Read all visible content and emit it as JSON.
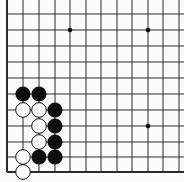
{
  "board": {
    "description": "Go board corner fragment (lower-left corner with stones)",
    "background": "#fbfbfb",
    "line_color": "#2a2a2a",
    "columns_x": [
      7,
      23,
      39,
      55,
      70,
      86,
      101,
      117,
      132,
      148,
      163,
      179
    ],
    "rows_y": [
      14,
      30,
      46,
      62,
      78,
      94,
      110,
      126,
      142,
      157,
      172
    ],
    "left_edge_x": 7,
    "bottom_edge_y": 172,
    "star_points": [
      {
        "col": 4,
        "row": 1
      },
      {
        "col": 9,
        "row": 1
      },
      {
        "col": 9,
        "row": 7
      }
    ],
    "stones": [
      {
        "color": "black",
        "col": 1,
        "row": 5
      },
      {
        "color": "black",
        "col": 2,
        "row": 5
      },
      {
        "color": "white",
        "col": 1,
        "row": 6
      },
      {
        "color": "white",
        "col": 2,
        "row": 6
      },
      {
        "color": "black",
        "col": 3,
        "row": 6
      },
      {
        "color": "white",
        "col": 2,
        "row": 7
      },
      {
        "color": "black",
        "col": 3,
        "row": 7
      },
      {
        "color": "white",
        "col": 2,
        "row": 8
      },
      {
        "color": "black",
        "col": 3,
        "row": 8
      },
      {
        "color": "white",
        "col": 1,
        "row": 9
      },
      {
        "color": "black",
        "col": 2,
        "row": 9
      },
      {
        "color": "black",
        "col": 3,
        "row": 9
      },
      {
        "color": "white",
        "col": 1,
        "row": 10
      }
    ]
  }
}
